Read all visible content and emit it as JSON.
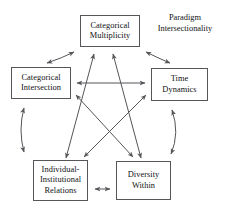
{
  "figure": {
    "line_color": "#55555a",
    "text_color": "#111114",
    "background": "#ffffff"
  },
  "caption": {
    "line1": "Paradigm",
    "line2": "Intersectionality"
  },
  "nodes": [
    {
      "id": "categorical-multiplicity",
      "line1": "Categorical",
      "line2": "Multiplicity"
    },
    {
      "id": "categorical-intersection",
      "line1": "Categorical",
      "line2": "Intersection"
    },
    {
      "id": "time-dynamics",
      "line1": "Time",
      "line2": "Dynamics"
    },
    {
      "id": "individual-institutional-relations",
      "line1": "Individual-",
      "line2": "Institutional",
      "line3": "Relations"
    },
    {
      "id": "diversity-within",
      "line1": "Diversity",
      "line2": "Within"
    }
  ],
  "edges": [
    {
      "id": "multiplicity-to-intersection",
      "style": "curved",
      "heads": "both"
    },
    {
      "id": "multiplicity-to-time-dynamics",
      "style": "curved",
      "heads": "both"
    },
    {
      "id": "intersection-to-individual-institutional",
      "style": "curved",
      "heads": "both"
    },
    {
      "id": "time-dynamics-to-diversity-within",
      "style": "curved",
      "heads": "both"
    },
    {
      "id": "individual-institutional-to-diversity-within",
      "style": "straight",
      "heads": "both"
    },
    {
      "id": "intersection-to-time-dynamics",
      "style": "straight",
      "heads": "both"
    },
    {
      "id": "multiplicity-to-individual-institutional",
      "style": "straight",
      "heads": "both"
    },
    {
      "id": "multiplicity-to-diversity-within",
      "style": "straight",
      "heads": "both"
    },
    {
      "id": "intersection-to-diversity-within",
      "style": "straight",
      "heads": "both"
    },
    {
      "id": "time-dynamics-to-individual-institutional",
      "style": "straight",
      "heads": "both"
    }
  ]
}
